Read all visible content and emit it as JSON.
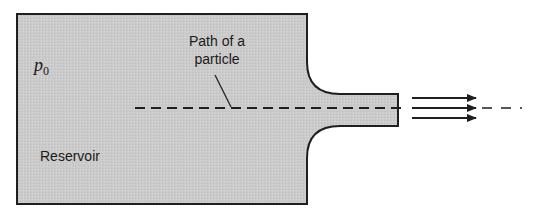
{
  "figure": {
    "type": "schematic",
    "colors": {
      "fill": "#c9c9c9",
      "stroke": "#1f1f1f",
      "background": "#ffffff"
    }
  },
  "labels": {
    "pressure_symbol": "p",
    "pressure_subscript": "0",
    "path_line1": "Path of a",
    "path_line2": "particle",
    "reservoir": "Reservoir"
  },
  "flow_arrows": {
    "count": 3,
    "direction": "right"
  }
}
